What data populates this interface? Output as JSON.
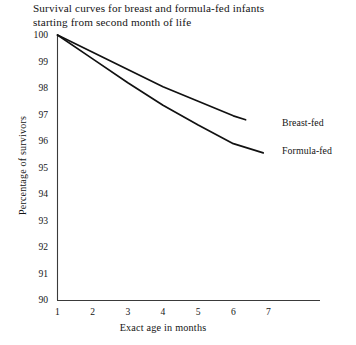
{
  "chart_data": {
    "type": "line",
    "title": "Survival curves for breast and formula-fed infants\nstarting from second month of life",
    "xlabel": "Exact age in months",
    "ylabel": "Percentage of survivors",
    "xlim": [
      1,
      7.6
    ],
    "ylim": [
      90,
      100
    ],
    "xticks": [
      "1",
      "2",
      "3",
      "4",
      "5",
      "6",
      "7"
    ],
    "yticks": [
      "90",
      "91",
      "92",
      "93",
      "94",
      "95",
      "96",
      "97",
      "98",
      "99",
      "100"
    ],
    "grid": false,
    "legend_position": "inline-right-of-line-ends",
    "series": [
      {
        "name": "Breast-fed",
        "color": "#111111",
        "x": [
          1,
          2,
          3,
          4,
          5,
          6,
          6.35
        ],
        "y": [
          100,
          99.35,
          98.7,
          98.05,
          97.5,
          96.95,
          96.8
        ]
      },
      {
        "name": "Formula-fed",
        "color": "#111111",
        "x": [
          1,
          2,
          3,
          4,
          5,
          6,
          6.85
        ],
        "y": [
          100,
          99.1,
          98.2,
          97.35,
          96.6,
          95.9,
          95.55
        ]
      }
    ]
  },
  "axis": {
    "spine_color": "#333333"
  }
}
